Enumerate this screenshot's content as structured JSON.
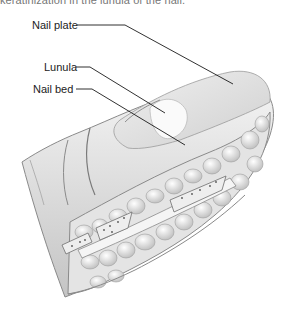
{
  "figure": {
    "top_caption_fragment": "keratinization in the lunula of the nail."
  },
  "labels": [
    {
      "id": "nail-plate",
      "text": "Nail plate",
      "x": 32,
      "y": 19,
      "line": [
        [
          77,
          25
        ],
        [
          125,
          25
        ],
        [
          233,
          84
        ]
      ]
    },
    {
      "id": "lunula",
      "text": "Lunula",
      "x": 44,
      "y": 61,
      "line": [
        [
          76,
          67
        ],
        [
          90,
          67
        ],
        [
          165,
          113
        ]
      ]
    },
    {
      "id": "nail-bed",
      "text": "Nail bed",
      "x": 33,
      "y": 83,
      "line": [
        [
          76,
          89
        ],
        [
          92,
          89
        ],
        [
          185,
          145
        ]
      ]
    }
  ],
  "colors": {
    "line": "#1a1a1a",
    "skin_light": "#f2f2f2",
    "skin_mid": "#d6d6d6",
    "skin_dark": "#9a9a9a",
    "text": "#222222"
  }
}
